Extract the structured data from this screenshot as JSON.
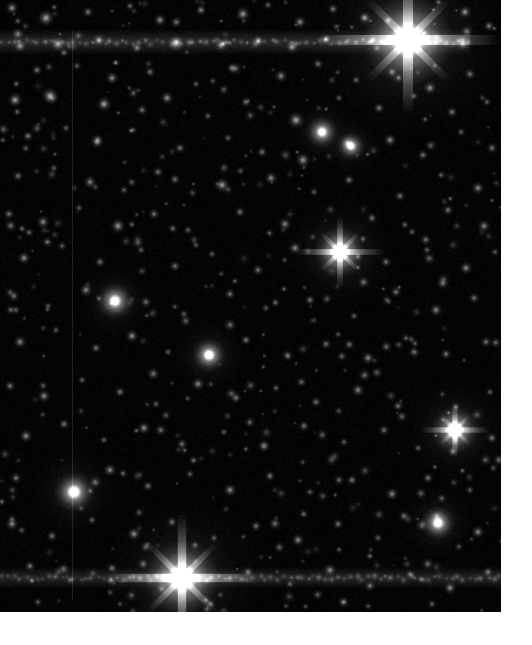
{
  "viewer": {
    "title": "Star Field Image Viewer",
    "panel_label": "astronomical-image",
    "image_region": {
      "x": 0,
      "y": 0,
      "width": 501,
      "height": 612
    },
    "background_color": "#000000",
    "page_background_color": "#ffffff",
    "star_color": "#ffffff",
    "colormap": "grayscale"
  },
  "chart_data": {
    "type": "scatter",
    "title": "",
    "xlabel": "",
    "ylabel": "",
    "xlim": [
      0,
      501
    ],
    "ylim": [
      0,
      612
    ],
    "grid": false,
    "legend": null,
    "background": "#000000",
    "point_color": "#ffffff",
    "noise_floor": 0.035,
    "artifacts": [
      {
        "name": "horizontal-streak-top",
        "type": "hline",
        "y": 42,
        "thickness": 13,
        "intensity": 0.3,
        "x_start": 0,
        "x_end": 470
      },
      {
        "name": "horizontal-streak-bottom",
        "type": "hline",
        "y": 578,
        "thickness": 11,
        "intensity": 0.26,
        "x_start": 0,
        "x_end": 501
      },
      {
        "name": "vertical-column-defect",
        "type": "vline",
        "x": 72,
        "thickness": 1,
        "intensity": 0.12,
        "y_start": 30,
        "y_end": 600
      }
    ],
    "bright_stars": [
      {
        "x": 408,
        "y": 40,
        "r": 46,
        "i": 1.0,
        "spikes": true,
        "spike_len": 92
      },
      {
        "x": 182,
        "y": 578,
        "r": 38,
        "i": 1.0,
        "spikes": true,
        "spike_len": 80
      },
      {
        "x": 340,
        "y": 252,
        "r": 26,
        "i": 0.95,
        "spikes": true,
        "spike_len": 44
      },
      {
        "x": 455,
        "y": 430,
        "r": 24,
        "i": 0.92,
        "spikes": true,
        "spike_len": 34
      },
      {
        "x": 74,
        "y": 492,
        "r": 20,
        "i": 0.9,
        "spikes": false,
        "spike_len": 0
      },
      {
        "x": 209,
        "y": 355,
        "r": 17,
        "i": 0.88,
        "spikes": false,
        "spike_len": 0
      },
      {
        "x": 115,
        "y": 301,
        "r": 18,
        "i": 0.85,
        "spikes": false,
        "spike_len": 0
      },
      {
        "x": 438,
        "y": 523,
        "r": 17,
        "i": 0.86,
        "spikes": false,
        "spike_len": 0
      },
      {
        "x": 322,
        "y": 132,
        "r": 16,
        "i": 0.82,
        "spikes": false,
        "spike_len": 0
      },
      {
        "x": 351,
        "y": 146,
        "r": 14,
        "i": 0.8,
        "spikes": false,
        "spike_len": 0
      }
    ],
    "point_sources": [
      {
        "x": 12,
        "y": 8,
        "r": 7,
        "i": 0.62
      },
      {
        "x": 46,
        "y": 18,
        "r": 9,
        "i": 0.74
      },
      {
        "x": 88,
        "y": 12,
        "r": 6,
        "i": 0.55
      },
      {
        "x": 130,
        "y": 6,
        "r": 5,
        "i": 0.48
      },
      {
        "x": 160,
        "y": 20,
        "r": 7,
        "i": 0.6
      },
      {
        "x": 201,
        "y": 10,
        "r": 6,
        "i": 0.58
      },
      {
        "x": 243,
        "y": 14,
        "r": 8,
        "i": 0.66
      },
      {
        "x": 268,
        "y": 5,
        "r": 5,
        "i": 0.45
      },
      {
        "x": 300,
        "y": 22,
        "r": 7,
        "i": 0.6
      },
      {
        "x": 333,
        "y": 9,
        "r": 6,
        "i": 0.52
      },
      {
        "x": 365,
        "y": 18,
        "r": 7,
        "i": 0.62
      },
      {
        "x": 465,
        "y": 12,
        "r": 7,
        "i": 0.64
      },
      {
        "x": 489,
        "y": 26,
        "r": 6,
        "i": 0.56
      },
      {
        "x": 20,
        "y": 46,
        "r": 7,
        "i": 0.6
      },
      {
        "x": 58,
        "y": 44,
        "r": 8,
        "i": 0.68
      },
      {
        "x": 99,
        "y": 40,
        "r": 7,
        "i": 0.62
      },
      {
        "x": 137,
        "y": 48,
        "r": 6,
        "i": 0.54
      },
      {
        "x": 176,
        "y": 43,
        "r": 9,
        "i": 0.76
      },
      {
        "x": 221,
        "y": 45,
        "r": 7,
        "i": 0.6
      },
      {
        "x": 258,
        "y": 41,
        "r": 6,
        "i": 0.56
      },
      {
        "x": 292,
        "y": 47,
        "r": 7,
        "i": 0.62
      },
      {
        "x": 463,
        "y": 44,
        "r": 7,
        "i": 0.6
      },
      {
        "x": 37,
        "y": 70,
        "r": 6,
        "i": 0.52
      },
      {
        "x": 77,
        "y": 66,
        "r": 5,
        "i": 0.44
      },
      {
        "x": 112,
        "y": 78,
        "r": 7,
        "i": 0.6
      },
      {
        "x": 150,
        "y": 72,
        "r": 6,
        "i": 0.5
      },
      {
        "x": 196,
        "y": 84,
        "r": 5,
        "i": 0.42
      },
      {
        "x": 232,
        "y": 68,
        "r": 6,
        "i": 0.52
      },
      {
        "x": 281,
        "y": 76,
        "r": 7,
        "i": 0.58
      },
      {
        "x": 318,
        "y": 64,
        "r": 6,
        "i": 0.5
      },
      {
        "x": 356,
        "y": 80,
        "r": 5,
        "i": 0.44
      },
      {
        "x": 392,
        "y": 72,
        "r": 6,
        "i": 0.52
      },
      {
        "x": 430,
        "y": 88,
        "r": 7,
        "i": 0.6
      },
      {
        "x": 470,
        "y": 74,
        "r": 6,
        "i": 0.5
      },
      {
        "x": 15,
        "y": 100,
        "r": 8,
        "i": 0.7
      },
      {
        "x": 50,
        "y": 96,
        "r": 9,
        "i": 0.74
      },
      {
        "x": 104,
        "y": 104,
        "r": 8,
        "i": 0.7
      },
      {
        "x": 142,
        "y": 110,
        "r": 6,
        "i": 0.5
      },
      {
        "x": 167,
        "y": 98,
        "r": 7,
        "i": 0.62
      },
      {
        "x": 208,
        "y": 116,
        "r": 5,
        "i": 0.42
      },
      {
        "x": 246,
        "y": 102,
        "r": 6,
        "i": 0.5
      },
      {
        "x": 296,
        "y": 120,
        "r": 9,
        "i": 0.72
      },
      {
        "x": 379,
        "y": 108,
        "r": 6,
        "i": 0.54
      },
      {
        "x": 414,
        "y": 96,
        "r": 5,
        "i": 0.44
      },
      {
        "x": 452,
        "y": 112,
        "r": 6,
        "i": 0.52
      },
      {
        "x": 487,
        "y": 102,
        "r": 5,
        "i": 0.46
      },
      {
        "x": 28,
        "y": 136,
        "r": 6,
        "i": 0.52
      },
      {
        "x": 66,
        "y": 128,
        "r": 5,
        "i": 0.42
      },
      {
        "x": 97,
        "y": 142,
        "r": 7,
        "i": 0.58
      },
      {
        "x": 133,
        "y": 130,
        "r": 5,
        "i": 0.4
      },
      {
        "x": 180,
        "y": 148,
        "r": 6,
        "i": 0.5
      },
      {
        "x": 228,
        "y": 138,
        "r": 5,
        "i": 0.44
      },
      {
        "x": 262,
        "y": 152,
        "r": 6,
        "i": 0.52
      },
      {
        "x": 303,
        "y": 160,
        "r": 8,
        "i": 0.66
      },
      {
        "x": 390,
        "y": 140,
        "r": 7,
        "i": 0.6
      },
      {
        "x": 423,
        "y": 155,
        "r": 6,
        "i": 0.5
      },
      {
        "x": 461,
        "y": 132,
        "r": 5,
        "i": 0.44
      },
      {
        "x": 492,
        "y": 148,
        "r": 6,
        "i": 0.5
      },
      {
        "x": 18,
        "y": 176,
        "r": 6,
        "i": 0.5
      },
      {
        "x": 54,
        "y": 168,
        "r": 5,
        "i": 0.42
      },
      {
        "x": 90,
        "y": 182,
        "r": 7,
        "i": 0.58
      },
      {
        "x": 124,
        "y": 190,
        "r": 5,
        "i": 0.44
      },
      {
        "x": 158,
        "y": 172,
        "r": 6,
        "i": 0.5
      },
      {
        "x": 222,
        "y": 185,
        "r": 8,
        "i": 0.68
      },
      {
        "x": 271,
        "y": 178,
        "r": 7,
        "i": 0.6
      },
      {
        "x": 314,
        "y": 192,
        "r": 5,
        "i": 0.42
      },
      {
        "x": 349,
        "y": 180,
        "r": 6,
        "i": 0.52
      },
      {
        "x": 400,
        "y": 196,
        "r": 6,
        "i": 0.5
      },
      {
        "x": 441,
        "y": 175,
        "r": 5,
        "i": 0.44
      },
      {
        "x": 478,
        "y": 188,
        "r": 7,
        "i": 0.58
      },
      {
        "x": 9,
        "y": 214,
        "r": 6,
        "i": 0.52
      },
      {
        "x": 43,
        "y": 222,
        "r": 7,
        "i": 0.6
      },
      {
        "x": 79,
        "y": 208,
        "r": 5,
        "i": 0.42
      },
      {
        "x": 118,
        "y": 226,
        "r": 8,
        "i": 0.66
      },
      {
        "x": 154,
        "y": 214,
        "r": 6,
        "i": 0.5
      },
      {
        "x": 188,
        "y": 230,
        "r": 5,
        "i": 0.44
      },
      {
        "x": 240,
        "y": 212,
        "r": 6,
        "i": 0.52
      },
      {
        "x": 285,
        "y": 224,
        "r": 7,
        "i": 0.58
      },
      {
        "x": 372,
        "y": 218,
        "r": 6,
        "i": 0.5
      },
      {
        "x": 412,
        "y": 232,
        "r": 5,
        "i": 0.44
      },
      {
        "x": 448,
        "y": 210,
        "r": 6,
        "i": 0.52
      },
      {
        "x": 484,
        "y": 226,
        "r": 7,
        "i": 0.58
      },
      {
        "x": 24,
        "y": 258,
        "r": 7,
        "i": 0.6
      },
      {
        "x": 62,
        "y": 246,
        "r": 5,
        "i": 0.42
      },
      {
        "x": 100,
        "y": 262,
        "r": 6,
        "i": 0.5
      },
      {
        "x": 141,
        "y": 250,
        "r": 5,
        "i": 0.44
      },
      {
        "x": 175,
        "y": 266,
        "r": 6,
        "i": 0.52
      },
      {
        "x": 212,
        "y": 254,
        "r": 5,
        "i": 0.4
      },
      {
        "x": 258,
        "y": 270,
        "r": 6,
        "i": 0.5
      },
      {
        "x": 295,
        "y": 248,
        "r": 7,
        "i": 0.58
      },
      {
        "x": 386,
        "y": 262,
        "r": 6,
        "i": 0.5
      },
      {
        "x": 427,
        "y": 250,
        "r": 5,
        "i": 0.44
      },
      {
        "x": 466,
        "y": 268,
        "r": 7,
        "i": 0.6
      },
      {
        "x": 495,
        "y": 252,
        "r": 5,
        "i": 0.42
      },
      {
        "x": 14,
        "y": 296,
        "r": 6,
        "i": 0.52
      },
      {
        "x": 48,
        "y": 306,
        "r": 5,
        "i": 0.42
      },
      {
        "x": 86,
        "y": 290,
        "r": 7,
        "i": 0.6
      },
      {
        "x": 146,
        "y": 302,
        "r": 6,
        "i": 0.5
      },
      {
        "x": 184,
        "y": 314,
        "r": 5,
        "i": 0.44
      },
      {
        "x": 230,
        "y": 294,
        "r": 6,
        "i": 0.52
      },
      {
        "x": 266,
        "y": 308,
        "r": 5,
        "i": 0.42
      },
      {
        "x": 310,
        "y": 300,
        "r": 6,
        "i": 0.5
      },
      {
        "x": 354,
        "y": 316,
        "r": 5,
        "i": 0.44
      },
      {
        "x": 396,
        "y": 292,
        "r": 6,
        "i": 0.52
      },
      {
        "x": 436,
        "y": 310,
        "r": 7,
        "i": 0.58
      },
      {
        "x": 474,
        "y": 298,
        "r": 6,
        "i": 0.5
      },
      {
        "x": 20,
        "y": 342,
        "r": 7,
        "i": 0.58
      },
      {
        "x": 56,
        "y": 330,
        "r": 5,
        "i": 0.42
      },
      {
        "x": 96,
        "y": 348,
        "r": 6,
        "i": 0.5
      },
      {
        "x": 132,
        "y": 336,
        "r": 7,
        "i": 0.62
      },
      {
        "x": 168,
        "y": 352,
        "r": 5,
        "i": 0.44
      },
      {
        "x": 246,
        "y": 340,
        "r": 6,
        "i": 0.52
      },
      {
        "x": 288,
        "y": 356,
        "r": 5,
        "i": 0.42
      },
      {
        "x": 326,
        "y": 344,
        "r": 6,
        "i": 0.5
      },
      {
        "x": 368,
        "y": 358,
        "r": 7,
        "i": 0.58
      },
      {
        "x": 406,
        "y": 338,
        "r": 5,
        "i": 0.44
      },
      {
        "x": 446,
        "y": 354,
        "r": 6,
        "i": 0.52
      },
      {
        "x": 486,
        "y": 342,
        "r": 6,
        "i": 0.5
      },
      {
        "x": 10,
        "y": 386,
        "r": 6,
        "i": 0.52
      },
      {
        "x": 44,
        "y": 396,
        "r": 7,
        "i": 0.6
      },
      {
        "x": 82,
        "y": 380,
        "r": 5,
        "i": 0.42
      },
      {
        "x": 120,
        "y": 392,
        "r": 6,
        "i": 0.5
      },
      {
        "x": 156,
        "y": 404,
        "r": 5,
        "i": 0.44
      },
      {
        "x": 198,
        "y": 384,
        "r": 7,
        "i": 0.6
      },
      {
        "x": 236,
        "y": 398,
        "r": 6,
        "i": 0.52
      },
      {
        "x": 276,
        "y": 388,
        "r": 5,
        "i": 0.42
      },
      {
        "x": 316,
        "y": 402,
        "r": 6,
        "i": 0.5
      },
      {
        "x": 358,
        "y": 390,
        "r": 7,
        "i": 0.58
      },
      {
        "x": 398,
        "y": 406,
        "r": 6,
        "i": 0.5
      },
      {
        "x": 490,
        "y": 392,
        "r": 5,
        "i": 0.44
      },
      {
        "x": 26,
        "y": 436,
        "r": 7,
        "i": 0.62
      },
      {
        "x": 64,
        "y": 424,
        "r": 6,
        "i": 0.52
      },
      {
        "x": 104,
        "y": 440,
        "r": 5,
        "i": 0.44
      },
      {
        "x": 144,
        "y": 428,
        "r": 7,
        "i": 0.6
      },
      {
        "x": 182,
        "y": 444,
        "r": 6,
        "i": 0.5
      },
      {
        "x": 224,
        "y": 432,
        "r": 5,
        "i": 0.42
      },
      {
        "x": 264,
        "y": 446,
        "r": 7,
        "i": 0.62
      },
      {
        "x": 304,
        "y": 426,
        "r": 6,
        "i": 0.52
      },
      {
        "x": 344,
        "y": 442,
        "r": 5,
        "i": 0.44
      },
      {
        "x": 384,
        "y": 430,
        "r": 6,
        "i": 0.5
      },
      {
        "x": 418,
        "y": 448,
        "r": 5,
        "i": 0.42
      },
      {
        "x": 492,
        "y": 438,
        "r": 6,
        "i": 0.52
      },
      {
        "x": 16,
        "y": 478,
        "r": 6,
        "i": 0.52
      },
      {
        "x": 110,
        "y": 470,
        "r": 7,
        "i": 0.6
      },
      {
        "x": 148,
        "y": 486,
        "r": 6,
        "i": 0.5
      },
      {
        "x": 190,
        "y": 474,
        "r": 5,
        "i": 0.44
      },
      {
        "x": 230,
        "y": 490,
        "r": 7,
        "i": 0.62
      },
      {
        "x": 270,
        "y": 476,
        "r": 6,
        "i": 0.52
      },
      {
        "x": 310,
        "y": 492,
        "r": 5,
        "i": 0.42
      },
      {
        "x": 352,
        "y": 480,
        "r": 6,
        "i": 0.5
      },
      {
        "x": 392,
        "y": 494,
        "r": 7,
        "i": 0.58
      },
      {
        "x": 428,
        "y": 478,
        "r": 6,
        "i": 0.52
      },
      {
        "x": 470,
        "y": 490,
        "r": 5,
        "i": 0.44
      },
      {
        "x": 12,
        "y": 524,
        "r": 7,
        "i": 0.6
      },
      {
        "x": 52,
        "y": 536,
        "r": 6,
        "i": 0.52
      },
      {
        "x": 92,
        "y": 520,
        "r": 5,
        "i": 0.44
      },
      {
        "x": 134,
        "y": 534,
        "r": 7,
        "i": 0.62
      },
      {
        "x": 172,
        "y": 522,
        "r": 6,
        "i": 0.5
      },
      {
        "x": 214,
        "y": 538,
        "r": 5,
        "i": 0.42
      },
      {
        "x": 256,
        "y": 526,
        "r": 6,
        "i": 0.52
      },
      {
        "x": 298,
        "y": 540,
        "r": 7,
        "i": 0.58
      },
      {
        "x": 338,
        "y": 524,
        "r": 6,
        "i": 0.5
      },
      {
        "x": 378,
        "y": 538,
        "r": 5,
        "i": 0.44
      },
      {
        "x": 404,
        "y": 516,
        "r": 6,
        "i": 0.52
      },
      {
        "x": 478,
        "y": 532,
        "r": 7,
        "i": 0.6
      },
      {
        "x": 30,
        "y": 566,
        "r": 6,
        "i": 0.52
      },
      {
        "x": 70,
        "y": 580,
        "r": 5,
        "i": 0.44
      },
      {
        "x": 112,
        "y": 568,
        "r": 6,
        "i": 0.5
      },
      {
        "x": 248,
        "y": 572,
        "r": 6,
        "i": 0.52
      },
      {
        "x": 290,
        "y": 584,
        "r": 5,
        "i": 0.42
      },
      {
        "x": 330,
        "y": 570,
        "r": 7,
        "i": 0.58
      },
      {
        "x": 370,
        "y": 586,
        "r": 6,
        "i": 0.5
      },
      {
        "x": 410,
        "y": 574,
        "r": 5,
        "i": 0.44
      },
      {
        "x": 450,
        "y": 588,
        "r": 7,
        "i": 0.6
      },
      {
        "x": 488,
        "y": 572,
        "r": 6,
        "i": 0.52
      },
      {
        "x": 38,
        "y": 602,
        "r": 5,
        "i": 0.42
      },
      {
        "x": 120,
        "y": 604,
        "r": 4,
        "i": 0.38
      },
      {
        "x": 206,
        "y": 600,
        "r": 5,
        "i": 0.44
      },
      {
        "x": 286,
        "y": 606,
        "r": 4,
        "i": 0.36
      },
      {
        "x": 344,
        "y": 602,
        "r": 5,
        "i": 0.42
      },
      {
        "x": 432,
        "y": 604,
        "r": 5,
        "i": 0.44
      }
    ],
    "faint_source_count": 420,
    "faint_source_seed": 20240517
  }
}
